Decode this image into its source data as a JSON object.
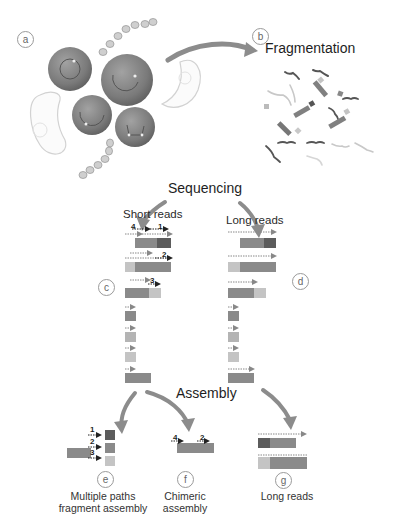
{
  "diagram": {
    "type": "workflow",
    "steps": {
      "a": {
        "marker": "a",
        "content": "Microbial community (cells and bacteria)"
      },
      "b": {
        "marker": "b",
        "title": "Fragmentation"
      },
      "sequencing": {
        "title": "Sequencing"
      },
      "c": {
        "marker": "c",
        "title": "Short reads"
      },
      "d": {
        "marker": "d",
        "title": "Long reads"
      },
      "assembly": {
        "title": "Assembly"
      },
      "e": {
        "marker": "e",
        "caption_line1": "Multiple paths",
        "caption_line2": "fragment assembly",
        "read_numbers": [
          "1",
          "2",
          "3"
        ]
      },
      "f": {
        "marker": "f",
        "caption_line1": "Chimeric",
        "caption_line2": "assembly",
        "read_numbers": [
          "4",
          "2"
        ]
      },
      "g": {
        "marker": "g",
        "caption": "Long reads"
      }
    },
    "short_read_numbers": {
      "row1_left": "4",
      "row1_right": "1",
      "row2": "2",
      "row3": "3"
    },
    "colors": {
      "dark": "#5a5a5a",
      "mid": "#8a8a8a",
      "light": "#c4c4c4",
      "arrow": "#8c8c8c",
      "cell": "#7d7d7d"
    }
  }
}
